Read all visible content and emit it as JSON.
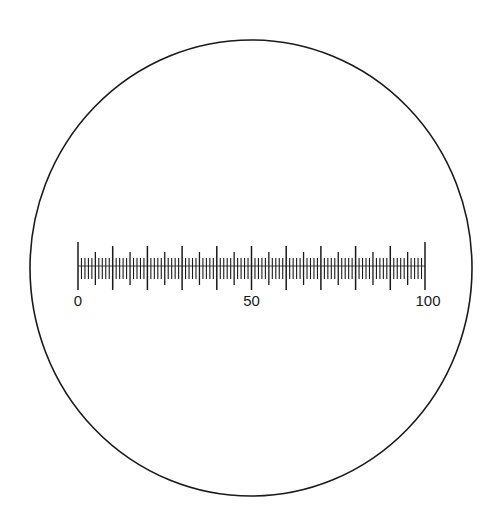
{
  "diagram": {
    "field_of_view": {
      "cx": 251,
      "cy": 268,
      "rx": 221,
      "ry": 228,
      "stroke": "#1a1a1a"
    },
    "scale": {
      "min": 0,
      "max": 100,
      "x_start": 78,
      "x_end": 425,
      "baseline_y": 266,
      "minor_step": 1,
      "medium_step": 5,
      "major_step": 10,
      "ticks": {
        "minor": {
          "y1": 258,
          "y2": 279
        },
        "medium": {
          "y1": 252,
          "y2": 285
        },
        "major": {
          "y1": 246,
          "y2": 290
        },
        "end": {
          "y1": 242,
          "y2": 290
        }
      },
      "color": "#1a1a1a"
    },
    "labels": [
      {
        "text": "0",
        "value": 0
      },
      {
        "text": "50",
        "value": 50
      },
      {
        "text": "100",
        "value": 100
      }
    ],
    "label_y": 306
  }
}
